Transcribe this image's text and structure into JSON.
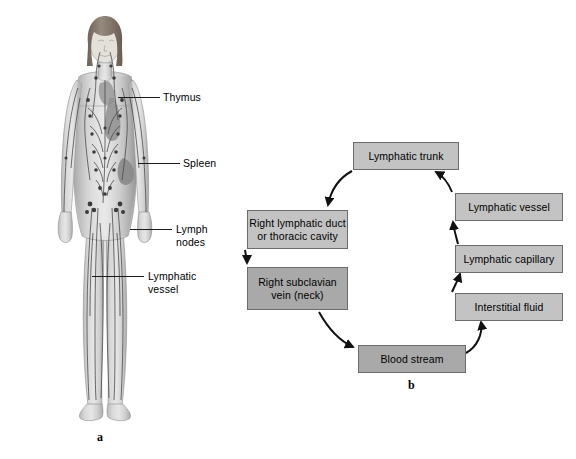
{
  "figure": {
    "panel_a": {
      "letter": "a",
      "caption_icon": "human-body-lymphatic-system-illustration",
      "labels": [
        {
          "id": "thymus",
          "text": "Thymus"
        },
        {
          "id": "spleen",
          "text": "Spleen"
        },
        {
          "id": "lymph-nodes",
          "text": "Lymph\nnodes"
        },
        {
          "id": "lymphatic-vessel",
          "text": "Lymphatic\nvessel"
        }
      ]
    },
    "panel_b": {
      "letter": "b",
      "boxes": [
        {
          "id": "lymphatic-trunk",
          "text": "Lymphatic trunk"
        },
        {
          "id": "lymphatic-vessel",
          "text": "Lymphatic vessel"
        },
        {
          "id": "lymphatic-capillary",
          "text": "Lymphatic capillary"
        },
        {
          "id": "interstitial-fluid",
          "text": "Interstitial fluid"
        },
        {
          "id": "blood-stream",
          "text": "Blood stream"
        },
        {
          "id": "right-subclavian-vein",
          "text": "Right subclavian\nvein (neck)"
        },
        {
          "id": "right-lymphatic-duct",
          "text": "Right lymphatic duct\nor thoracic cavity"
        }
      ],
      "flow_order": [
        "interstitial-fluid",
        "lymphatic-capillary",
        "lymphatic-vessel",
        "lymphatic-trunk",
        "right-lymphatic-duct",
        "right-subclavian-vein",
        "blood-stream",
        "interstitial-fluid"
      ]
    }
  },
  "colors": {
    "box_fill": "#c3c3c3",
    "box_fill_dark": "#a9a9a9",
    "box_border": "#6b6b6b",
    "arrow": "#111111",
    "text": "#000000",
    "background": "#ffffff"
  }
}
